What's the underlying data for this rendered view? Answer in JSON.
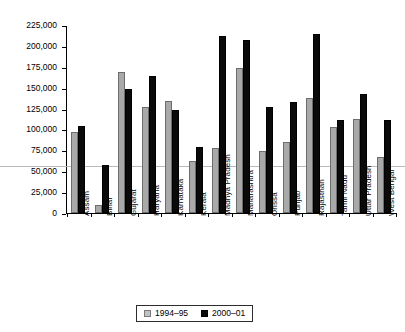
{
  "chart_data": {
    "type": "bar",
    "title": "",
    "xlabel": "",
    "ylabel": "Rupees/employee",
    "ylim": [
      0,
      225000
    ],
    "y_ticks": [
      "0",
      "25,000",
      "50,000",
      "75,000",
      "100,000",
      "125,000",
      "150,000",
      "175,000",
      "200,000",
      "225,000"
    ],
    "y_tick_values": [
      0,
      25000,
      50000,
      75000,
      100000,
      125000,
      150000,
      175000,
      200000,
      225000
    ],
    "grid": false,
    "legend_position": "bottom",
    "categories": [
      "Assam",
      "Bihar",
      "Gujarat",
      "Haryana",
      "Karnataka",
      "Kerala",
      "Madhya Pradesh",
      "Maharashtra",
      "Orissa",
      "Punjab",
      "Rajasthan",
      "Tamil Nadu",
      "Uttar Pradesh",
      "West Bengal"
    ],
    "series": [
      {
        "name": "1994–95",
        "color": "#a9a9a9",
        "values": [
          98000,
          10000,
          170000,
          128000,
          135000,
          62000,
          78000,
          175000,
          75000,
          85000,
          138000,
          104000,
          113000,
          67000
        ]
      },
      {
        "name": "2000–01",
        "color": "#0a0a0a",
        "values": [
          105000,
          58000,
          149000,
          165000,
          124000,
          79000,
          213000,
          208000,
          127000,
          133000,
          215000,
          112000,
          143000,
          112000
        ]
      }
    ]
  },
  "legend": {
    "items": [
      {
        "label": "1994–95"
      },
      {
        "label": "2000–01"
      }
    ]
  }
}
